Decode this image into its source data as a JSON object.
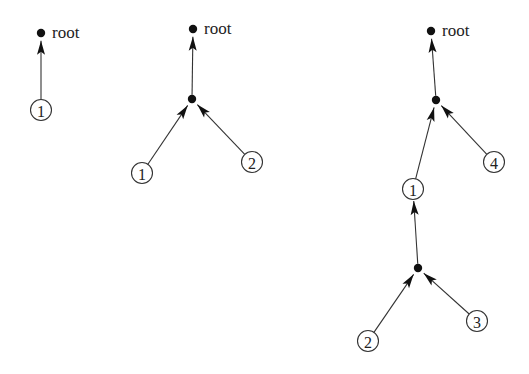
{
  "diagram": {
    "colors": {
      "ink": "#111111",
      "line": "#333333",
      "background": "#ffffff"
    },
    "trees": [
      {
        "id": "tree-1",
        "nodes": [
          {
            "id": "r",
            "type": "dot",
            "x": 41,
            "y": 33,
            "label": "root"
          },
          {
            "id": "n1",
            "type": "leaf",
            "x": 41,
            "y": 110,
            "label": "1"
          }
        ],
        "edges": [
          {
            "from": "n1",
            "to": "r"
          }
        ]
      },
      {
        "id": "tree-2",
        "nodes": [
          {
            "id": "r",
            "type": "dot",
            "x": 193,
            "y": 29,
            "label": "root"
          },
          {
            "id": "m",
            "type": "dot",
            "x": 192,
            "y": 99
          },
          {
            "id": "n1",
            "type": "leaf",
            "x": 142,
            "y": 173,
            "label": "1"
          },
          {
            "id": "n2",
            "type": "leaf",
            "x": 252,
            "y": 162,
            "label": "2"
          }
        ],
        "edges": [
          {
            "from": "m",
            "to": "r"
          },
          {
            "from": "n1",
            "to": "m"
          },
          {
            "from": "n2",
            "to": "m"
          }
        ]
      },
      {
        "id": "tree-3",
        "nodes": [
          {
            "id": "r",
            "type": "dot",
            "x": 431,
            "y": 31,
            "label": "root"
          },
          {
            "id": "m",
            "type": "dot",
            "x": 436,
            "y": 100
          },
          {
            "id": "n1",
            "type": "leaf",
            "x": 413,
            "y": 189,
            "label": "1"
          },
          {
            "id": "n4",
            "type": "leaf",
            "x": 494,
            "y": 162,
            "label": "4"
          },
          {
            "id": "m2",
            "type": "dot",
            "x": 418,
            "y": 268
          },
          {
            "id": "n2",
            "type": "leaf",
            "x": 368,
            "y": 341,
            "label": "2"
          },
          {
            "id": "n3",
            "type": "leaf",
            "x": 477,
            "y": 321,
            "label": "3"
          }
        ],
        "edges": [
          {
            "from": "m",
            "to": "r"
          },
          {
            "from": "n1",
            "to": "m"
          },
          {
            "from": "n4",
            "to": "m"
          },
          {
            "from": "m2",
            "to": "n1"
          },
          {
            "from": "n2",
            "to": "m2"
          },
          {
            "from": "n3",
            "to": "m2"
          }
        ]
      }
    ]
  }
}
